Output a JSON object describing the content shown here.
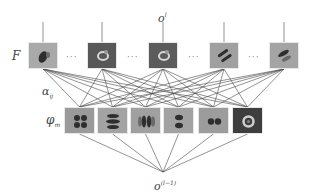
{
  "diagram": {
    "type": "network-decomposition",
    "labels": {
      "output": "o",
      "output_sup": "l",
      "input": "o",
      "input_sup": "(l−1)",
      "filters": "F",
      "coefficients": "α",
      "coefficients_sub": "ij",
      "basis": "φ",
      "basis_sub": "m"
    },
    "ellipsis": "···",
    "filters": [
      {
        "x": 28,
        "bg": "#a9a9a9",
        "pattern": "blob-dark"
      },
      {
        "x": 87,
        "bg": "#585858",
        "pattern": "ring-light"
      },
      {
        "x": 148,
        "bg": "#5c5c5c",
        "pattern": "ring-light"
      },
      {
        "x": 209,
        "bg": "#a0a0a0",
        "pattern": "diagonal-stripes"
      },
      {
        "x": 269,
        "bg": "#a4a4a4",
        "pattern": "diagonal-blob"
      }
    ],
    "basis": [
      {
        "x": 64,
        "bg": "#9a9a9a",
        "pattern": "four-dots"
      },
      {
        "x": 97,
        "bg": "#a3a3a3",
        "pattern": "horizontal-bands"
      },
      {
        "x": 130,
        "bg": "#a0a0a0",
        "pattern": "vertical-bands"
      },
      {
        "x": 163,
        "bg": "#a2a2a2",
        "pattern": "two-dots-vertical"
      },
      {
        "x": 198,
        "bg": "#9c9c9c",
        "pattern": "two-dots-horizontal"
      },
      {
        "x": 232,
        "bg": "#3e3e3e",
        "pattern": "ring"
      }
    ],
    "colors": {
      "line": "#4a4a4a",
      "label": "#444444"
    }
  }
}
